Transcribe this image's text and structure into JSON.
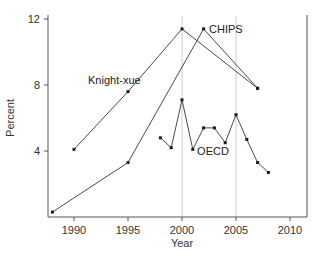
{
  "chart_data": {
    "type": "line",
    "title": "",
    "xlabel": "Year",
    "ylabel": "Percent",
    "xlim": [
      1987.5,
      2011.5
    ],
    "ylim": [
      0,
      12.5
    ],
    "x_ticks": [
      1990,
      1995,
      2000,
      2005,
      2010
    ],
    "y_ticks": [
      4,
      8,
      12
    ],
    "reference_lines_x": [
      2000,
      2005
    ],
    "grid": false,
    "legend": "inline labels",
    "series": [
      {
        "name": "Knight-xue",
        "x": [
          1990,
          1995,
          2000,
          2007
        ],
        "values": [
          4.1,
          7.6,
          11.4,
          7.8
        ]
      },
      {
        "name": "CHIPS",
        "x": [
          1988,
          1995,
          2002,
          2007
        ],
        "values": [
          0.3,
          3.3,
          11.4,
          7.8
        ]
      },
      {
        "name": "OECD",
        "x": [
          1998,
          1999,
          2000,
          2001,
          2002,
          2003,
          2004,
          2005,
          2006,
          2007,
          2008
        ],
        "values": [
          4.8,
          4.2,
          7.1,
          4.1,
          5.4,
          5.4,
          4.5,
          6.2,
          4.7,
          3.3,
          2.7
        ]
      }
    ],
    "annotations": [
      {
        "text": "Knight-xue",
        "x": 1991.3,
        "y": 8.3
      },
      {
        "text": "CHIPS",
        "x": 2002.5,
        "y": 11.4
      },
      {
        "text": "OECD",
        "x": 2001.4,
        "y": 4.0
      }
    ]
  },
  "colors": {
    "line": "#4a4a4a",
    "marker": "#1a1a1a",
    "axis": "#555555",
    "refline": "#cccccc"
  }
}
